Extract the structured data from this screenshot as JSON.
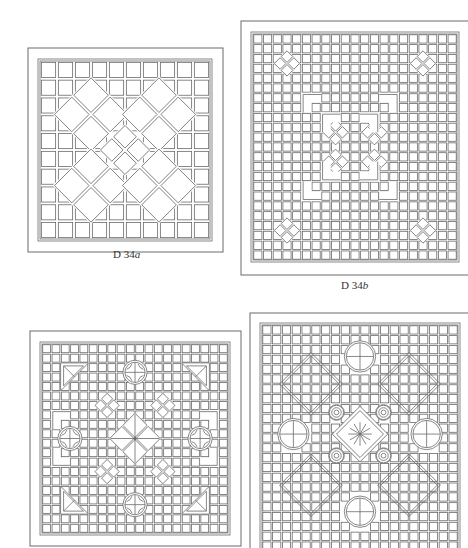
{
  "page": {
    "background": "#ffffff",
    "line_color": "#6a6a6a"
  },
  "panels": [
    {
      "id": "D34a",
      "caption_prefix": "D 34",
      "caption_suffix": "a",
      "outer": {
        "x": 28,
        "y": 48,
        "w": 195,
        "h": 204
      },
      "inner": {
        "x": 38,
        "y": 59,
        "w": 174,
        "h": 182
      },
      "grid": {
        "cols": 10,
        "rows": 10
      },
      "caption_pos": {
        "x": 113,
        "y": 248
      },
      "motifs": [
        {
          "type": "diamond-lattice",
          "cx": 3.0,
          "cy": 3.0,
          "r": 1.6
        },
        {
          "type": "diamond-lattice",
          "cx": 7.0,
          "cy": 3.0,
          "r": 1.6
        },
        {
          "type": "diamond-lattice",
          "cx": 3.0,
          "cy": 7.0,
          "r": 1.6
        },
        {
          "type": "diamond-lattice",
          "cx": 7.0,
          "cy": 7.0,
          "r": 1.6
        },
        {
          "type": "diamond-lattice",
          "cx": 5.0,
          "cy": 5.0,
          "r": 1.1
        }
      ]
    },
    {
      "id": "D34b",
      "caption_prefix": "D 34",
      "caption_suffix": "b",
      "outer": {
        "x": 241,
        "y": 21,
        "w": 235,
        "h": 254
      },
      "inner": {
        "x": 251,
        "y": 32,
        "w": 208,
        "h": 230
      },
      "grid": {
        "cols": 21,
        "rows": 23
      },
      "caption_pos": {
        "x": 341,
        "y": 279
      },
      "motifs": [
        {
          "type": "small-star",
          "cx": 3.5,
          "cy": 3.0
        },
        {
          "type": "small-star",
          "cx": 17.5,
          "cy": 3.0
        },
        {
          "type": "small-star",
          "cx": 3.5,
          "cy": 20.0
        },
        {
          "type": "small-star",
          "cx": 17.5,
          "cy": 20.0
        },
        {
          "type": "small-star",
          "cx": 8.5,
          "cy": 10.0
        },
        {
          "type": "small-star",
          "cx": 12.5,
          "cy": 10.0
        },
        {
          "type": "small-star",
          "cx": 8.5,
          "cy": 13.0
        },
        {
          "type": "small-star",
          "cx": 12.5,
          "cy": 13.0
        },
        {
          "type": "corner",
          "x": 5,
          "y": 6,
          "dir": "tl"
        },
        {
          "type": "corner",
          "x": 15,
          "y": 6,
          "dir": "tr"
        },
        {
          "type": "corner",
          "x": 7,
          "y": 8,
          "dir": "tl"
        },
        {
          "type": "corner",
          "x": 13,
          "y": 8,
          "dir": "tr"
        },
        {
          "type": "corner",
          "x": 7,
          "y": 15,
          "dir": "bl"
        },
        {
          "type": "corner",
          "x": 13,
          "y": 15,
          "dir": "br"
        },
        {
          "type": "corner",
          "x": 5,
          "y": 17,
          "dir": "bl"
        },
        {
          "type": "corner",
          "x": 15,
          "y": 17,
          "dir": "br"
        }
      ]
    },
    {
      "id": "D34c",
      "caption_prefix": "",
      "caption_suffix": "",
      "outer": {
        "x": 30,
        "y": 331,
        "w": 211,
        "h": 215
      },
      "inner": {
        "x": 40,
        "y": 342,
        "w": 190,
        "h": 193
      },
      "grid": {
        "cols": 20,
        "rows": 20
      },
      "motifs": [
        {
          "type": "cross-circle",
          "cx": 10.0,
          "cy": 3.0,
          "r": 1.3
        },
        {
          "type": "cross-circle",
          "cx": 10.0,
          "cy": 17.0,
          "r": 1.3
        },
        {
          "type": "cross-circle",
          "cx": 3.0,
          "cy": 10.0,
          "r": 1.3
        },
        {
          "type": "cross-circle",
          "cx": 17.0,
          "cy": 10.0,
          "r": 1.3
        },
        {
          "type": "center-diamond",
          "cx": 10.0,
          "cy": 10.0,
          "r": 2.0
        },
        {
          "type": "triangle",
          "x": 2,
          "y": 2,
          "dir": "tl"
        },
        {
          "type": "triangle",
          "x": 18,
          "y": 2,
          "dir": "tr"
        },
        {
          "type": "triangle",
          "x": 2,
          "y": 18,
          "dir": "bl"
        },
        {
          "type": "triangle",
          "x": 18,
          "y": 18,
          "dir": "br"
        },
        {
          "type": "small-star",
          "cx": 7.0,
          "cy": 6.5
        },
        {
          "type": "small-star",
          "cx": 13.0,
          "cy": 6.5
        },
        {
          "type": "small-star",
          "cx": 7.0,
          "cy": 13.5
        },
        {
          "type": "small-star",
          "cx": 13.0,
          "cy": 13.5
        },
        {
          "type": "corner",
          "x": 1,
          "y": 7,
          "dir": "tl"
        },
        {
          "type": "corner",
          "x": 19,
          "y": 7,
          "dir": "tr"
        },
        {
          "type": "corner",
          "x": 1,
          "y": 13,
          "dir": "bl"
        },
        {
          "type": "corner",
          "x": 19,
          "y": 13,
          "dir": "br"
        }
      ]
    },
    {
      "id": "D34d",
      "caption_prefix": "",
      "caption_suffix": "",
      "outer": {
        "x": 250,
        "y": 313,
        "w": 225,
        "h": 245
      },
      "inner": {
        "x": 260,
        "y": 323,
        "w": 200,
        "h": 230
      },
      "grid": {
        "cols": 20,
        "rows": 23
      },
      "motifs": [
        {
          "type": "circle-cross",
          "cx": 10.0,
          "cy": 3.2,
          "r": 1.6
        },
        {
          "type": "circle-cross",
          "cx": 10.0,
          "cy": 19.0,
          "r": 1.6
        },
        {
          "type": "circle-cross",
          "cx": 3.2,
          "cy": 11.1,
          "r": 1.6
        },
        {
          "type": "circle-cross",
          "cx": 16.8,
          "cy": 11.1,
          "r": 1.6
        },
        {
          "type": "octagon-frame",
          "cx": 5.0,
          "cy": 6.0,
          "r": 3.2
        },
        {
          "type": "octagon-frame",
          "cx": 15.0,
          "cy": 6.0,
          "r": 3.2
        },
        {
          "type": "octagon-frame",
          "cx": 5.0,
          "cy": 16.3,
          "r": 3.2
        },
        {
          "type": "octagon-frame",
          "cx": 15.0,
          "cy": 16.3,
          "r": 3.2
        },
        {
          "type": "rosette",
          "cx": 7.6,
          "cy": 8.9,
          "r": 0.8
        },
        {
          "type": "rosette",
          "cx": 12.4,
          "cy": 8.9,
          "r": 0.8
        },
        {
          "type": "rosette",
          "cx": 7.6,
          "cy": 13.3,
          "r": 0.8
        },
        {
          "type": "rosette",
          "cx": 12.4,
          "cy": 13.3,
          "r": 0.8
        },
        {
          "type": "starburst-diamond",
          "cx": 10.0,
          "cy": 11.1,
          "r": 2.0
        }
      ]
    }
  ]
}
